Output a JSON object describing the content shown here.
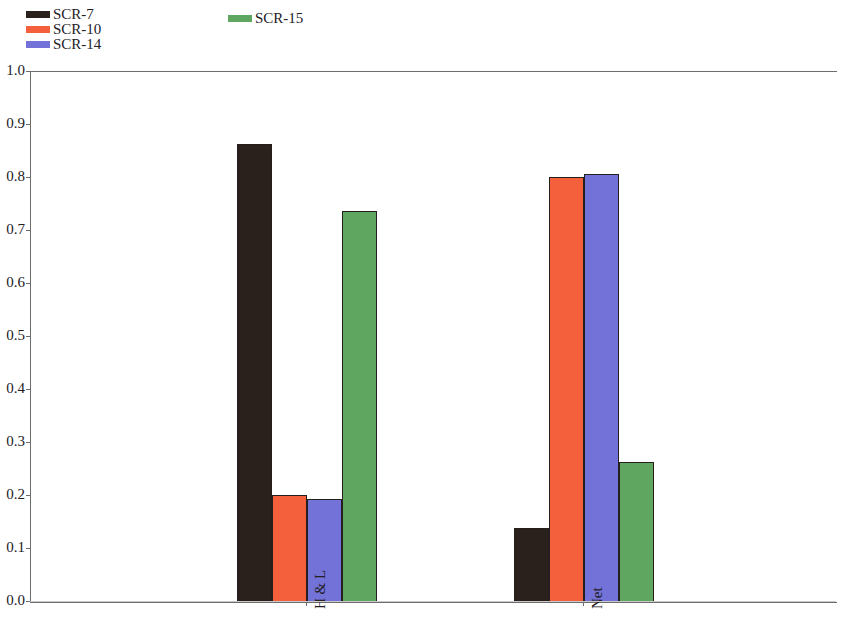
{
  "chart_data": {
    "type": "bar",
    "title": "",
    "subtitle": "",
    "xlabel": "",
    "ylabel": "",
    "categories": [
      "H & L",
      "Net"
    ],
    "series": [
      {
        "name": "SCR-7",
        "color": "#2a201c",
        "values": [
          0.865,
          0.14
        ]
      },
      {
        "name": "SCR-10",
        "color": "#f4603c",
        "values": [
          0.202,
          0.801
        ]
      },
      {
        "name": "SCR-14",
        "color": "#7272d8",
        "values": [
          0.195,
          0.807
        ]
      },
      {
        "name": "SCR-15",
        "color": "#5fa760",
        "values": [
          0.738,
          0.265
        ]
      }
    ],
    "ylim": [
      0.0,
      1.0
    ],
    "ytick_labels": [
      "0.0",
      "0.1",
      "0.2",
      "0.3",
      "0.4",
      "0.5",
      "0.6",
      "0.7",
      "0.8",
      "0.9",
      "1.0"
    ],
    "ytick_values": [
      0.0,
      0.1,
      0.2,
      0.3,
      0.4,
      0.5,
      0.6,
      0.7,
      0.8,
      0.9,
      1.0
    ],
    "xtick_labels": [
      "H & L",
      "Net"
    ],
    "grid": false,
    "legend_position": "top",
    "legend_entries": [
      {
        "label": "SCR-7",
        "color": "#2a201c"
      },
      {
        "label": "SCR-10",
        "color": "#f4603c"
      },
      {
        "label": "SCR-14",
        "color": "#7272d8"
      },
      {
        "label": "SCR-15",
        "color": "#5fa760"
      }
    ],
    "bar_border_color": "#241f1d",
    "axis_color": "#6d6d6d"
  }
}
